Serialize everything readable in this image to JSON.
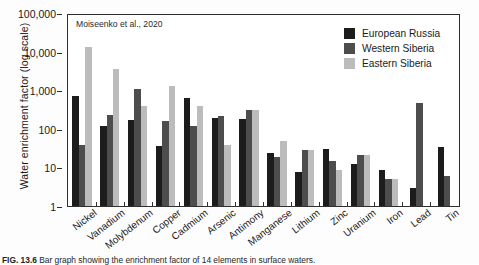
{
  "chart_data": {
    "type": "bar",
    "title": "",
    "annotation": "Moiseenko et al., 2020",
    "xlabel": "",
    "ylabel": "Water enrichment factor (log scale)",
    "scale": "log",
    "ylim": [
      1,
      100000
    ],
    "grid": false,
    "legend_position": "top-right",
    "ytick_labels": [
      "100,000",
      "10,000",
      "1,000",
      "100",
      "10",
      "1"
    ],
    "ytick_values": [
      100000,
      10000,
      1000,
      100,
      10,
      1
    ],
    "categories": [
      "Nickel",
      "Vanadium",
      "Molybdenum",
      "Copper",
      "Cadmium",
      "Arsenic",
      "Antimony",
      "Manganese",
      "Lithium",
      "Zinc",
      "Uranium",
      "Iron",
      "Lead",
      "Tin"
    ],
    "series": [
      {
        "name": "European Russia",
        "color": "#1c1c1c",
        "values": [
          800,
          130,
          180,
          37,
          700,
          210,
          200,
          25,
          8,
          32,
          13,
          9,
          3,
          35
        ]
      },
      {
        "name": "Western Siberia",
        "color": "#4d4d4d",
        "values": [
          40,
          250,
          1200,
          170,
          130,
          230,
          330,
          20,
          30,
          15,
          22,
          5,
          500,
          6
        ]
      },
      {
        "name": "Eastern Siberia",
        "color": "#bcbcbc",
        "values": [
          15000,
          4000,
          430,
          1400,
          430,
          40,
          330,
          50,
          30,
          9,
          22,
          5,
          null,
          null
        ]
      }
    ]
  },
  "caption": {
    "figure_number": "FIG. 13.6",
    "text": "Bar graph showing the enrichment factor of 14 elements in surface waters."
  }
}
